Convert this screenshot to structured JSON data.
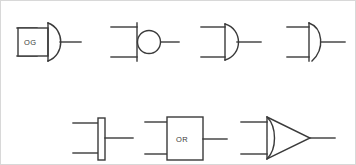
{
  "figure": {
    "background_color": "#ffffff",
    "border_color": "#d8d8d8",
    "stroke_color": "#3a3a3a",
    "width": 356,
    "height": 165,
    "row_count": 2
  },
  "symbols": [
    {
      "id": "symbol-1",
      "name": "labeled-box-d-shape-gate",
      "row": 1,
      "column": 1,
      "label": "OG",
      "has_label": true,
      "shape": "rectangle-with-curved-right-arc",
      "input_count": 2,
      "output_count": 1,
      "has_bubble": false
    },
    {
      "id": "symbol-2",
      "name": "vertical-bar-with-circle-gate",
      "row": 1,
      "column": 2,
      "label": "",
      "has_label": false,
      "shape": "vertical-line-with-circle",
      "input_count": 2,
      "output_count": 1,
      "has_bubble": true
    },
    {
      "id": "symbol-3",
      "name": "d-shape-gate-small",
      "row": 1,
      "column": 3,
      "label": "",
      "has_label": false,
      "shape": "vertical-line-with-right-arc",
      "input_count": 2,
      "output_count": 1,
      "has_bubble": false
    },
    {
      "id": "symbol-4",
      "name": "d-shape-gate-pointed",
      "row": 1,
      "column": 4,
      "label": "",
      "has_label": false,
      "shape": "vertical-line-with-pointed-arc",
      "input_count": 2,
      "output_count": 1,
      "has_bubble": false
    },
    {
      "id": "symbol-5",
      "name": "narrow-vertical-bar-gate",
      "row": 2,
      "column": 1,
      "label": "",
      "has_label": false,
      "shape": "narrow-vertical-rectangle",
      "input_count": 2,
      "output_count": 1,
      "has_bubble": false
    },
    {
      "id": "symbol-6",
      "name": "labeled-rectangle-gate",
      "row": 2,
      "column": 2,
      "label": "OR",
      "has_label": true,
      "shape": "rectangle",
      "input_count": 2,
      "output_count": 1,
      "has_bubble": false
    },
    {
      "id": "symbol-7",
      "name": "triangle-gate-curved-back",
      "row": 2,
      "column": 3,
      "label": "",
      "has_label": false,
      "shape": "triangle-with-curved-left-edge",
      "input_count": 2,
      "output_count": 1,
      "has_bubble": false
    }
  ]
}
